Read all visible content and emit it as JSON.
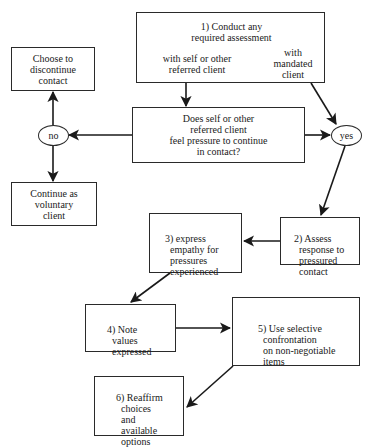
{
  "diagram": {
    "type": "flowchart",
    "nodes": {
      "step1": {
        "title": "1) Conduct any\nrequired assessment",
        "branch_left": "with self or other\nreferred client",
        "branch_right": "with\nmandated\nclient"
      },
      "question": {
        "label": "Does self or other\nreferred client\nfeel pressure to continue\nin contact?"
      },
      "no": {
        "label": "no"
      },
      "yes": {
        "label": "yes"
      },
      "discontinue": {
        "label": "Choose to\ndiscontinue\ncontact"
      },
      "voluntary": {
        "label": "Continue as\nvoluntary\nclient"
      },
      "step2": {
        "label": "2) Assess\n    response to\n    pressured\n    contact"
      },
      "step3": {
        "label": "3) express\n    empathy for\n    pressures\n    experienced"
      },
      "step4": {
        "label": "4) Note\n    values\n    expressed"
      },
      "step5": {
        "label": "5) Use selective\n    confrontation\n    on non-negotiable\n    items"
      },
      "step6": {
        "label": "6) Reaffirm\n    choices\n    and\n    available\n    options"
      }
    },
    "edges": [
      {
        "from": "step1 (self or other referred)",
        "to": "question"
      },
      {
        "from": "step1 (mandated)",
        "to": "yes"
      },
      {
        "from": "question",
        "to": "no"
      },
      {
        "from": "question",
        "to": "yes"
      },
      {
        "from": "no",
        "to": "discontinue"
      },
      {
        "from": "no",
        "to": "voluntary"
      },
      {
        "from": "yes",
        "to": "step2"
      },
      {
        "from": "step2",
        "to": "step3"
      },
      {
        "from": "step3",
        "to": "step4"
      },
      {
        "from": "step4",
        "to": "step5"
      },
      {
        "from": "step5",
        "to": "step6"
      }
    ]
  }
}
